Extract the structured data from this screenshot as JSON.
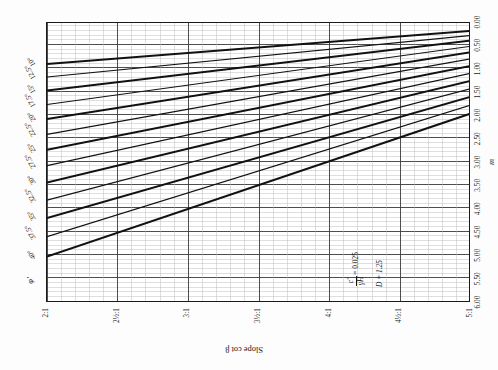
{
  "chart_data": {
    "type": "line",
    "title": "",
    "subtitle": "",
    "xlabel": "Slope cot β",
    "ylabel": "m",
    "xlim": [
      2,
      5
    ],
    "ylim": [
      0,
      6
    ],
    "x_tick_labels": [
      "2:1",
      "2½:1",
      "3:1",
      "3½:1",
      "4:1",
      "4½:1",
      "5:1"
    ],
    "x_tick_values": [
      2,
      2.5,
      3,
      3.5,
      4,
      4.5,
      5
    ],
    "y_tick_labels": [
      "0.00",
      "0.50",
      "1.00",
      "1.50",
      "2.00",
      "2.50",
      "3.00",
      "3.50",
      "4.00",
      "4.50",
      "5.00",
      "5.50",
      "6.00"
    ],
    "y_tick_values": [
      0,
      0.5,
      1,
      1.5,
      2,
      2.5,
      3,
      3.5,
      4,
      4.5,
      5,
      5.5,
      6
    ],
    "grid": true,
    "grid_minor": true,
    "legend_position": "top-edge-inline",
    "legend_title": "φ′",
    "annotations": [
      "c′/γH = 0.025",
      "D = 1.25"
    ],
    "series": [
      {
        "name": "40°",
        "label": "40°",
        "x": [
          2.0,
          5.0
        ],
        "y": [
          5.05,
          1.98
        ]
      },
      {
        "name": "37.5°",
        "label": "37.5°",
        "x": [
          2.0,
          5.0
        ],
        "y": [
          4.62,
          1.8
        ]
      },
      {
        "name": "35°",
        "label": "35°",
        "x": [
          2.0,
          5.0
        ],
        "y": [
          4.22,
          1.62
        ]
      },
      {
        "name": "32.5°",
        "label": "32.5°",
        "x": [
          2.0,
          5.0
        ],
        "y": [
          3.84,
          1.45
        ]
      },
      {
        "name": "30°",
        "label": "30°",
        "x": [
          2.0,
          5.0
        ],
        "y": [
          3.46,
          1.28
        ]
      },
      {
        "name": "27.5°",
        "label": "27.5°",
        "x": [
          2.0,
          5.0
        ],
        "y": [
          3.1,
          1.12
        ]
      },
      {
        "name": "25°",
        "label": "25°",
        "x": [
          2.0,
          5.0
        ],
        "y": [
          2.76,
          0.96
        ]
      },
      {
        "name": "22.5°",
        "label": "22.5°",
        "x": [
          2.0,
          5.0
        ],
        "y": [
          2.43,
          0.81
        ]
      },
      {
        "name": "20°",
        "label": "20°",
        "x": [
          2.0,
          5.0
        ],
        "y": [
          2.1,
          0.67
        ]
      },
      {
        "name": "17.5°",
        "label": "17.5°",
        "x": [
          2.0,
          5.0
        ],
        "y": [
          1.79,
          0.54
        ]
      },
      {
        "name": "15°",
        "label": "15°",
        "x": [
          2.0,
          5.0
        ],
        "y": [
          1.49,
          0.42
        ]
      },
      {
        "name": "12.5°",
        "label": "12.5°",
        "x": [
          2.0,
          5.0
        ],
        "y": [
          1.2,
          0.31
        ]
      },
      {
        "name": "10°",
        "label": "10°",
        "x": [
          2.0,
          5.0
        ],
        "y": [
          0.92,
          0.21
        ]
      }
    ]
  },
  "figure": {
    "phi_symbol": "φ′",
    "x_axis_title": "Slope cot β",
    "y_axis_title": "m",
    "annotation": {
      "ratio_numerator": "c′",
      "ratio_denominator": "γH",
      "ratio_equals": "= 0.025",
      "depth_factor": "D = 1.25"
    },
    "angle_labels": [
      "40°",
      "37.5°",
      "35°",
      "32.5°",
      "30°",
      "27.5°",
      "25°",
      "22.5°",
      "20°",
      "17.5°",
      "15°",
      "12.5°",
      "10°"
    ],
    "x_tick_labels": [
      "2:1",
      "2½:1",
      "3:1",
      "3½:1",
      "4:1",
      "4½:1",
      "5:1"
    ],
    "y_tick_labels": [
      "0.00",
      "0.50",
      "1.00",
      "1.50",
      "2.00",
      "2.50",
      "3.00",
      "3.50",
      "4.00",
      "4.50",
      "5.00",
      "5.50",
      "6.00"
    ],
    "colors": {
      "line": "#111111",
      "grid_major": "#3b3b3b",
      "grid_minor": "#b8b8b8",
      "frame": "#1a1a1a",
      "background": "#ffffff"
    }
  }
}
